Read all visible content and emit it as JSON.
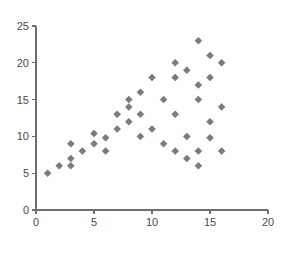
{
  "chart_data": {
    "type": "scatter",
    "title": "",
    "subtitle": "",
    "xlabel": "",
    "ylabel": "",
    "xlim": [
      0,
      20
    ],
    "ylim": [
      0,
      25
    ],
    "xticks": [
      0,
      5,
      10,
      15,
      20
    ],
    "yticks": [
      0,
      5,
      10,
      15,
      20,
      25
    ],
    "xtick_labels": [
      "0",
      "5",
      "10",
      "15",
      "20"
    ],
    "ytick_labels": [
      "0",
      "5",
      "10",
      "15",
      "20",
      "25"
    ],
    "grid": false,
    "legend": null,
    "legend_position": "none",
    "marker": "diamond",
    "marker_color": "#7b7b7b",
    "marker_edge_color": "#5d5d5d",
    "background_color": "#ffffff",
    "axis_color": "#6e6e6e",
    "series": [
      {
        "name": "series-1",
        "points": [
          [
            1,
            5
          ],
          [
            2,
            6
          ],
          [
            3,
            6
          ],
          [
            3,
            7
          ],
          [
            3,
            9
          ],
          [
            4,
            8
          ],
          [
            5,
            9
          ],
          [
            5,
            10.4
          ],
          [
            6,
            8
          ],
          [
            6,
            9.8
          ],
          [
            7,
            11
          ],
          [
            7,
            13
          ],
          [
            8,
            12
          ],
          [
            8,
            14
          ],
          [
            8,
            15
          ],
          [
            9,
            10
          ],
          [
            9,
            13
          ],
          [
            9,
            16
          ],
          [
            10,
            11
          ],
          [
            10,
            18
          ],
          [
            11,
            9
          ],
          [
            11,
            15
          ],
          [
            12,
            8
          ],
          [
            12,
            13
          ],
          [
            12,
            18
          ],
          [
            12,
            20
          ],
          [
            13,
            7
          ],
          [
            13,
            10
          ],
          [
            13,
            19
          ],
          [
            14,
            6
          ],
          [
            14,
            8
          ],
          [
            14,
            15
          ],
          [
            14,
            17
          ],
          [
            14,
            23
          ],
          [
            15,
            9.8
          ],
          [
            15,
            12
          ],
          [
            15,
            18
          ],
          [
            15,
            21
          ],
          [
            16,
            8
          ],
          [
            16,
            14
          ],
          [
            16,
            20
          ]
        ]
      }
    ]
  },
  "geometry": {
    "plot_left": 36,
    "plot_right": 268,
    "plot_top": 26,
    "plot_bottom": 210,
    "tick_length": 4,
    "marker_size": 7
  }
}
